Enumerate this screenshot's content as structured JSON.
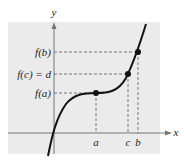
{
  "diagram": {
    "type": "intermediate-value-theorem-graph",
    "axes": {
      "x_label": "x",
      "y_label": "y"
    },
    "y_labels": {
      "fb": "f(b)",
      "fc": "f(c) = d",
      "fa": "f(a)"
    },
    "x_labels": {
      "a": "a",
      "c": "c",
      "b": "b"
    },
    "points": [
      {
        "name": "point-a",
        "label": "(a, f(a))"
      },
      {
        "name": "point-c",
        "label": "(c, f(c))"
      },
      {
        "name": "point-b",
        "label": "(b, f(b))"
      }
    ],
    "colors": {
      "background_panel": "#ebebeb",
      "curve": "#111111",
      "axes": "#666666",
      "dashes": "#555555"
    }
  }
}
